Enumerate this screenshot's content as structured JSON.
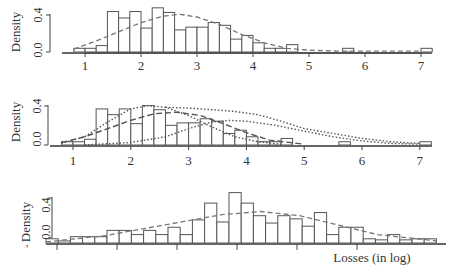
{
  "figure": {
    "xlabel": "Losses (in log)",
    "ylabel": "Density"
  },
  "chart_data": [
    {
      "type": "bar",
      "panel": "top",
      "title": "",
      "xlabel": "",
      "ylabel": "Density",
      "xlim": [
        0.7,
        7.3
      ],
      "ylim": [
        0,
        0.5
      ],
      "x_ticks": [
        "1",
        "2",
        "3",
        "4",
        "5",
        "6",
        "7"
      ],
      "y_ticks": [
        "0.0",
        "0.4"
      ],
      "histogram": {
        "bin_width": 0.2,
        "bin_starts": [
          0.8,
          1.0,
          1.2,
          1.4,
          1.6,
          1.8,
          2.0,
          2.2,
          2.4,
          2.6,
          2.8,
          3.0,
          3.2,
          3.4,
          3.6,
          3.8,
          4.0,
          4.2,
          4.4,
          4.6,
          5.6,
          7.0
        ],
        "values": [
          0.04,
          0.04,
          0.07,
          0.44,
          0.37,
          0.44,
          0.26,
          0.48,
          0.43,
          0.24,
          0.27,
          0.27,
          0.32,
          0.29,
          0.14,
          0.18,
          0.1,
          0.04,
          0.04,
          0.08,
          0.04,
          0.04
        ]
      },
      "series": [
        {
          "name": "fitted density",
          "style": "dashed",
          "x": [
            0.8,
            1.2,
            1.6,
            2.0,
            2.4,
            2.7,
            3.0,
            3.4,
            3.8,
            4.2,
            4.6,
            5.0,
            5.5,
            6.0,
            7.0
          ],
          "values": [
            0.03,
            0.12,
            0.22,
            0.32,
            0.39,
            0.41,
            0.38,
            0.3,
            0.19,
            0.1,
            0.04,
            0.02,
            0.01,
            0.01,
            0.01
          ]
        }
      ]
    },
    {
      "type": "bar",
      "panel": "middle",
      "title": "",
      "xlabel": "",
      "ylabel": "Density",
      "xlim": [
        0.7,
        7.3
      ],
      "ylim": [
        0,
        0.5
      ],
      "x_ticks": [
        "1",
        "2",
        "3",
        "4",
        "5",
        "6",
        "7"
      ],
      "y_ticks": [
        "0.0",
        "0.4"
      ],
      "histogram": {
        "bin_width": 0.2,
        "bin_starts": [
          0.8,
          1.0,
          1.2,
          1.4,
          1.6,
          1.8,
          2.0,
          2.2,
          2.4,
          2.6,
          2.8,
          3.0,
          3.2,
          3.4,
          3.6,
          3.8,
          4.0,
          4.2,
          4.4,
          4.6,
          5.6,
          7.0
        ],
        "values": [
          0.04,
          0.04,
          0.07,
          0.44,
          0.37,
          0.44,
          0.26,
          0.48,
          0.43,
          0.24,
          0.27,
          0.27,
          0.32,
          0.29,
          0.14,
          0.18,
          0.1,
          0.04,
          0.04,
          0.08,
          0.04,
          0.04
        ]
      },
      "series": [
        {
          "name": "density 1",
          "style": "dotted",
          "x": [
            0.8,
            1.2,
            1.6,
            2.0,
            2.3,
            2.6,
            3.0,
            3.4,
            3.8,
            4.2,
            4.6
          ],
          "values": [
            0.02,
            0.1,
            0.28,
            0.44,
            0.48,
            0.46,
            0.36,
            0.22,
            0.1,
            0.04,
            0.01
          ]
        },
        {
          "name": "density 2",
          "style": "dashed",
          "x": [
            0.8,
            1.2,
            1.6,
            2.0,
            2.4,
            2.8,
            3.2,
            3.6,
            4.0,
            4.4,
            5.0
          ],
          "values": [
            0.03,
            0.1,
            0.2,
            0.3,
            0.38,
            0.4,
            0.36,
            0.26,
            0.15,
            0.06,
            0.01
          ]
        },
        {
          "name": "density 3",
          "style": "dotted",
          "x": [
            1.2,
            2.0,
            2.6,
            3.0,
            3.4,
            3.7,
            4.0,
            4.5,
            5.0,
            5.5,
            6.0,
            6.5,
            7.0
          ],
          "values": [
            0.0,
            0.03,
            0.1,
            0.2,
            0.28,
            0.3,
            0.29,
            0.24,
            0.17,
            0.1,
            0.05,
            0.02,
            0.01
          ]
        },
        {
          "name": "density 4",
          "style": "dotted",
          "x": [
            2.6,
            3.0,
            3.4,
            3.8,
            4.2,
            4.6,
            5.0,
            5.5,
            6.0,
            6.5,
            7.0
          ],
          "values": [
            0.46,
            0.45,
            0.43,
            0.41,
            0.37,
            0.29,
            0.2,
            0.14,
            0.08,
            0.04,
            0.02
          ]
        }
      ]
    },
    {
      "type": "bar",
      "panel": "bottom",
      "title": "",
      "xlabel": "Losses (in log)",
      "ylabel": "Density",
      "ylim": [
        0,
        0.5
      ],
      "x_ticks": [
        "",
        "",
        "",
        "",
        "",
        ""
      ],
      "y_ticks": [
        "0.0",
        "0.4"
      ],
      "histogram": {
        "bin_index": [
          0,
          1,
          2,
          3,
          4,
          5,
          6,
          7,
          8,
          9,
          10,
          11,
          12,
          13,
          14,
          15,
          16,
          17,
          18,
          19,
          20,
          21,
          22,
          23,
          24,
          25,
          26,
          27,
          28,
          29,
          30,
          31
        ],
        "values": [
          0.04,
          0.02,
          0.06,
          0.06,
          0.06,
          0.12,
          0.12,
          0.08,
          0.12,
          0.08,
          0.15,
          0.08,
          0.22,
          0.38,
          0.2,
          0.48,
          0.38,
          0.26,
          0.19,
          0.26,
          0.23,
          0.16,
          0.29,
          0.08,
          0.15,
          0.15,
          0.04,
          0.03,
          0.08,
          0.03,
          0.04,
          0.04
        ]
      },
      "series": [
        {
          "name": "fitted density",
          "style": "dashed",
          "x_frac": [
            0.0,
            0.15,
            0.3,
            0.45,
            0.55,
            0.65,
            0.75,
            0.85,
            1.0
          ],
          "values": [
            0.01,
            0.07,
            0.17,
            0.27,
            0.3,
            0.26,
            0.17,
            0.08,
            0.02
          ]
        }
      ]
    }
  ]
}
